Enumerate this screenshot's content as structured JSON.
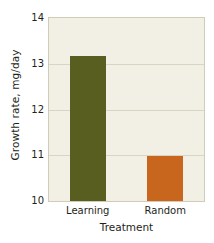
{
  "chart_data": {
    "type": "bar",
    "title": "",
    "subtitle": "",
    "xlabel": "Treatment",
    "ylabel": "Growth rate, mg/day",
    "categories": [
      "Learning",
      "Random"
    ],
    "values": [
      13.17,
      10.99
    ],
    "series": [
      {
        "name": "Growth rate",
        "values": [
          13.17,
          10.99
        ]
      }
    ],
    "ylim": [
      10,
      14
    ],
    "yticks": [
      10,
      11,
      12,
      13,
      14
    ],
    "ytick_labels": [
      "10",
      "11",
      "12",
      "13",
      "14"
    ],
    "xtick_labels": [
      "Learning",
      "Random"
    ],
    "grid": true,
    "grid_axis": "y",
    "legend": false,
    "legend_position": "none",
    "bar_colors": [
      "#585e20",
      "#c8661e"
    ],
    "annotations": []
  },
  "style": {
    "plot_background": "#f2f0e4",
    "page_background": "#ffffff",
    "gridline_color": "#d8d5c4",
    "axis_border_color": "#cfccb9",
    "text_color": "#231f20",
    "learning_bar_color": "#585e20",
    "random_bar_color": "#c8661e"
  }
}
